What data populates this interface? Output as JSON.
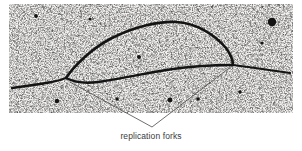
{
  "figure": {
    "type": "electron-micrograph",
    "caption": "replication forks",
    "panel": {
      "x": 9,
      "y": 4,
      "width": 284,
      "height": 109,
      "background_color": "#f2f1ef",
      "grain_color": "#1a1a1a"
    },
    "strand_color": "#141414",
    "leader_color": "#4a4a4a",
    "caption_color": "#3a3a3a",
    "annotations": {
      "leader_apex": {
        "x": 152,
        "y": 127
      },
      "left_fork_point": {
        "x": 70,
        "y": 82
      },
      "right_fork_point": {
        "x": 232,
        "y": 66
      }
    },
    "strands": {
      "left_tail": "M 12,88 L 26,86 L 40,84 L 52,82 L 60,80 L 66,78",
      "upper_arc": "M 66,78 C 74,66 92,48 112,38 C 134,27 158,21 176,22 C 196,23 214,34 226,48 C 231,55 233,62 233,65",
      "lower_arc": "M 66,78 C 74,82 84,84 98,82 C 120,79 142,74 166,70 C 192,66 216,65 233,65",
      "right_tail": "M 233,65 L 248,67 L 262,69 L 276,71 L 290,73"
    },
    "blobs": [
      {
        "x": 272,
        "y": 22,
        "r": 4.2
      },
      {
        "x": 139,
        "y": 57,
        "r": 2.0
      },
      {
        "x": 57,
        "y": 101,
        "r": 2.2
      },
      {
        "x": 198,
        "y": 99,
        "r": 1.8
      },
      {
        "x": 170,
        "y": 100,
        "r": 2.4
      },
      {
        "x": 36,
        "y": 16,
        "r": 1.9
      },
      {
        "x": 240,
        "y": 92,
        "r": 1.8
      },
      {
        "x": 90,
        "y": 19,
        "r": 1.6
      },
      {
        "x": 117,
        "y": 99,
        "r": 1.7
      },
      {
        "x": 262,
        "y": 43,
        "r": 1.6
      }
    ],
    "bubble_label": "A"
  }
}
